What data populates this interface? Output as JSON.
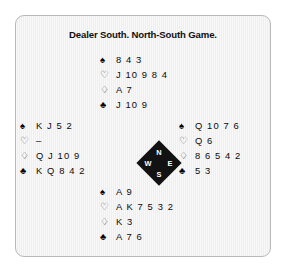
{
  "figure": {
    "title": "Dealer South. North-South Game.",
    "panel_color": "#f1f1f1",
    "border_color": "#b9b9b9",
    "text_color": "#0b0b0b"
  },
  "suits": {
    "spade": {
      "name": "spade-symbol",
      "glyph": "♠",
      "filled": true
    },
    "heart": {
      "name": "heart-symbol",
      "glyph": "♡",
      "filled": false
    },
    "diamond": {
      "name": "diamond-symbol",
      "glyph": "♢",
      "filled": false
    },
    "club": {
      "name": "club-symbol",
      "glyph": "♣",
      "filled": true
    }
  },
  "hands": {
    "north": {
      "position": "North",
      "spades": "8 4 3",
      "hearts": "J 10 9 8 4",
      "diamonds": "A 7",
      "clubs": "J 10 9"
    },
    "west": {
      "position": "West",
      "spades": "K J 5 2",
      "hearts": "–",
      "diamonds": "Q J 10 9",
      "clubs": "K Q 8 4 2"
    },
    "east": {
      "position": "East",
      "spades": "Q 10 7 6",
      "hearts": "Q 6",
      "diamonds": "8 6 5 4 2",
      "clubs": "5 3"
    },
    "south": {
      "position": "South",
      "spades": "A 9",
      "hearts": "A K 7 5 3 2",
      "diamonds": "K 3",
      "clubs": "A 7 6"
    }
  },
  "compass": {
    "north": "N",
    "west": "W",
    "east": "E",
    "south": "S",
    "color": "#121212",
    "label_color": "#ffffff"
  }
}
